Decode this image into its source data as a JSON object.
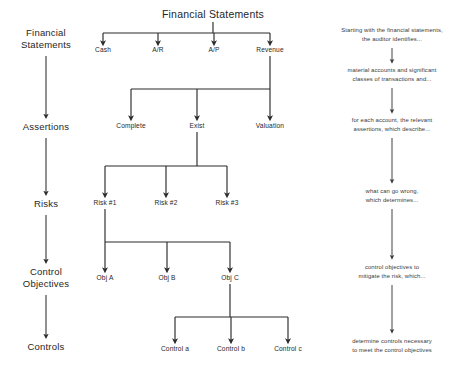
{
  "diagram": {
    "colors": {
      "line": "#2b2b2b",
      "text": "#262626",
      "background": "#ffffff"
    },
    "stage_column": {
      "name": "audit-stages",
      "items": [
        {
          "id": "stage-financial-statements",
          "lines": [
            "Financial",
            "Statements"
          ]
        },
        {
          "id": "stage-assertions",
          "lines": [
            "Assertions"
          ]
        },
        {
          "id": "stage-risks",
          "lines": [
            "Risks"
          ]
        },
        {
          "id": "stage-control-objectives",
          "lines": [
            "Control",
            "Objectives"
          ]
        },
        {
          "id": "stage-controls",
          "lines": [
            "Controls"
          ]
        }
      ]
    },
    "tree": {
      "root": {
        "id": "node-financial-statements",
        "label": "Financial Statements"
      },
      "levels": [
        {
          "id": "level-accounts",
          "parent": "node-financial-statements",
          "nodes": [
            {
              "id": "node-cash",
              "label": "Cash"
            },
            {
              "id": "node-ar",
              "label": "A/R"
            },
            {
              "id": "node-ap",
              "label": "A/P"
            },
            {
              "id": "node-revenue",
              "label": "Revenue"
            }
          ]
        },
        {
          "id": "level-assertions",
          "parent": "node-revenue",
          "nodes": [
            {
              "id": "node-complete",
              "label": "Complete"
            },
            {
              "id": "node-exist",
              "label": "Exist"
            },
            {
              "id": "node-valuation",
              "label": "Valuation"
            }
          ]
        },
        {
          "id": "level-risks",
          "parent": "node-exist",
          "nodes": [
            {
              "id": "node-risk-1",
              "label": "Risk #1"
            },
            {
              "id": "node-risk-2",
              "label": "Risk #2"
            },
            {
              "id": "node-risk-3",
              "label": "Risk #3"
            }
          ]
        },
        {
          "id": "level-objectives",
          "parent": "node-risk-1",
          "nodes": [
            {
              "id": "node-obj-a",
              "label": "Obj A"
            },
            {
              "id": "node-obj-b",
              "label": "Obj B"
            },
            {
              "id": "node-obj-c",
              "label": "Obj C"
            }
          ]
        },
        {
          "id": "level-controls",
          "parent": "node-obj-c",
          "nodes": [
            {
              "id": "node-control-a",
              "label": "Control a"
            },
            {
              "id": "node-control-b",
              "label": "Control b"
            },
            {
              "id": "node-control-c",
              "label": "Control c"
            }
          ]
        }
      ]
    },
    "narrative_column": {
      "name": "narrative-steps",
      "steps": [
        {
          "id": "narrative-step-1",
          "lines": [
            "Starting with the financial statements,",
            "the auditor identifies..."
          ]
        },
        {
          "id": "narrative-step-2",
          "lines": [
            "material accounts and significant",
            "classes of transactions and..."
          ]
        },
        {
          "id": "narrative-step-3",
          "lines": [
            "for each account, the relevant",
            "assertions, which describe..."
          ]
        },
        {
          "id": "narrative-step-4",
          "lines": [
            "what can go wrong,",
            "which determines..."
          ]
        },
        {
          "id": "narrative-step-5",
          "lines": [
            "control objectives to",
            "mitigate the risk, which..."
          ]
        },
        {
          "id": "narrative-step-6",
          "lines": [
            "determine controls necessary",
            "to meet the control objectives"
          ]
        }
      ]
    }
  }
}
